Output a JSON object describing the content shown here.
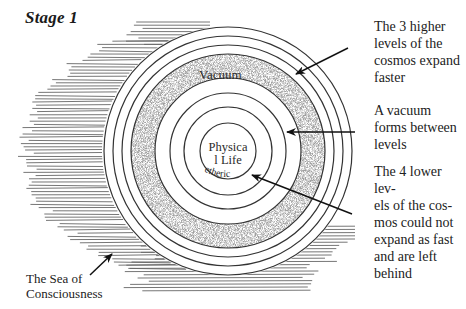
{
  "title": "Stage 1",
  "labels": {
    "vacuum": "Vacuum",
    "physical_life_line1": "Physica",
    "physical_life_line2": "l Life",
    "etheric": "etheric"
  },
  "annotations": {
    "higher_levels": "The 3 higher\nlevels of the\ncosmos expand\nfaster",
    "vacuum_forms": "A vacuum\nforms between\nlevels",
    "lower_levels": "The 4 lower lev-\nels of the cos-\nmos could not\nexpand as fast\nand are left\nbehind",
    "sea": "The Sea of\nConsciousness"
  },
  "diagram": {
    "outer_levels_count": 3,
    "inner_levels_count": 4,
    "colors": {
      "line": "#333333",
      "stipple": "#8a8a8a",
      "background": "#ffffff",
      "hatch": "#555555"
    }
  }
}
